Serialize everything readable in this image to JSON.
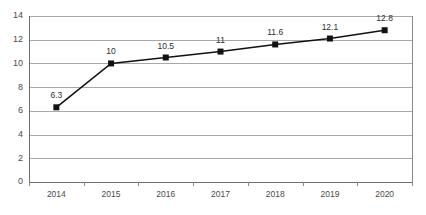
{
  "chart_data": {
    "type": "line",
    "title": "",
    "subtitle": "",
    "xlabel": "",
    "ylabel": "",
    "categories": [
      "2014",
      "2015",
      "2016",
      "2017",
      "2018",
      "2019",
      "2020"
    ],
    "values": [
      6.3,
      10,
      10.5,
      11,
      11.6,
      12.1,
      12.8
    ],
    "data_labels": [
      "6.3",
      "10",
      "10.5",
      "11",
      "11.6",
      "12.1",
      "12.8"
    ],
    "series": [
      {
        "name": "",
        "values": [
          6.3,
          10,
          10.5,
          11,
          11.6,
          12.1,
          12.8
        ],
        "color": "#111111",
        "marker": "square"
      }
    ],
    "ylim": [
      0,
      14
    ],
    "ytick_step": 2,
    "ytick_labels": [
      "0",
      "2",
      "4",
      "6",
      "8",
      "10",
      "12",
      "14"
    ],
    "ytick_values": [
      0,
      2,
      4,
      6,
      8,
      10,
      12,
      14
    ],
    "grid": {
      "horizontal": true,
      "vertical": false,
      "color": "#a8a8a8"
    },
    "legend": {
      "visible": false,
      "position": "none",
      "entries": []
    },
    "axis_colors": {
      "axis": "#6e6e6e",
      "frame": "#8a8a8a",
      "tick_text": "#4a4a4a",
      "data_label_text": "#2e2e2e"
    }
  }
}
